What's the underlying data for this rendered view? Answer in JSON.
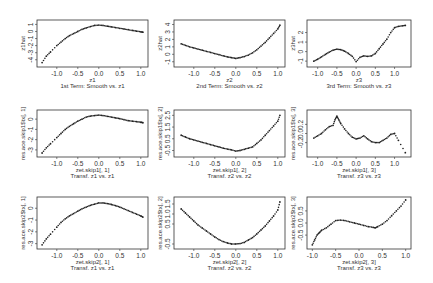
{
  "chart_data": [
    {
      "type": "scatter",
      "panel": [
        0,
        0
      ],
      "title": "1st Term: Smooth vs. z1",
      "xlabel": "z1",
      "ylabel": "z1hat",
      "xlim": [
        -1.4,
        1.1
      ],
      "ylim": [
        -4.6,
        1.2
      ],
      "xticks": [
        "-1.0",
        "-0.5",
        "0.0",
        "0.5",
        "1.0"
      ],
      "yticks": [
        "-4",
        "-3",
        "-2",
        "-1",
        "0",
        "1"
      ],
      "x": [
        -1.35,
        -1.25,
        -1.15,
        -1.0,
        -0.9,
        -0.8,
        -0.7,
        -0.6,
        -0.5,
        -0.4,
        -0.3,
        -0.2,
        -0.1,
        0.0,
        0.1,
        0.2,
        0.3,
        0.4,
        0.5,
        0.6,
        0.7,
        0.8,
        0.9,
        1.0,
        1.05
      ],
      "y": [
        -4.4,
        -3.5,
        -2.9,
        -2.0,
        -1.5,
        -1.0,
        -0.6,
        -0.3,
        0.0,
        0.3,
        0.5,
        0.7,
        0.85,
        0.9,
        0.85,
        0.75,
        0.65,
        0.55,
        0.45,
        0.35,
        0.25,
        0.15,
        0.05,
        -0.05,
        -0.1
      ]
    },
    {
      "type": "scatter",
      "panel": [
        0,
        1
      ],
      "title": "2nd Term: Smooth vs. z2",
      "xlabel": "z2",
      "ylabel": "z2hat",
      "xlim": [
        -1.4,
        1.1
      ],
      "ylim": [
        -1.3,
        4.2
      ],
      "xticks": [
        "-1.0",
        "-0.5",
        "0.0",
        "0.5",
        "1.0"
      ],
      "yticks": [
        "-1",
        "0",
        "1",
        "2",
        "3",
        "4"
      ],
      "x": [
        -1.3,
        -1.2,
        -1.1,
        -1.0,
        -0.9,
        -0.8,
        -0.7,
        -0.6,
        -0.5,
        -0.4,
        -0.3,
        -0.2,
        -0.1,
        0.0,
        0.1,
        0.2,
        0.3,
        0.4,
        0.5,
        0.6,
        0.7,
        0.8,
        0.9,
        1.0,
        1.05
      ],
      "y": [
        1.4,
        1.2,
        1.0,
        0.85,
        0.7,
        0.55,
        0.4,
        0.25,
        0.1,
        -0.05,
        -0.2,
        -0.35,
        -0.45,
        -0.55,
        -0.45,
        -0.3,
        -0.1,
        0.2,
        0.6,
        1.1,
        1.6,
        2.2,
        2.8,
        3.4,
        3.9
      ]
    },
    {
      "type": "scatter",
      "panel": [
        0,
        2
      ],
      "title": "3rd Term: Smooth vs. z3",
      "xlabel": "z3",
      "ylabel": "z3hat",
      "xlim": [
        -1.2,
        1.35
      ],
      "ylim": [
        -1.3,
        3.0
      ],
      "xticks": [
        "-1.0",
        "-0.5",
        "0.0",
        "0.5",
        "1.0"
      ],
      "yticks": [
        "-1",
        "0",
        "1",
        "2"
      ],
      "x": [
        -1.1,
        -1.0,
        -0.9,
        -0.8,
        -0.7,
        -0.6,
        -0.5,
        -0.4,
        -0.3,
        -0.2,
        -0.1,
        0.0,
        0.1,
        0.2,
        0.3,
        0.4,
        0.5,
        0.6,
        0.7,
        0.8,
        0.9,
        1.0,
        1.1,
        1.2,
        1.28
      ],
      "y": [
        -1.0,
        -0.8,
        -0.55,
        -0.3,
        -0.05,
        0.15,
        0.25,
        0.2,
        0.05,
        -0.2,
        -0.5,
        -1.05,
        -0.6,
        -0.45,
        -0.5,
        -0.45,
        -0.2,
        0.3,
        0.8,
        1.3,
        2.0,
        2.5,
        2.65,
        2.7,
        2.75
      ]
    },
    {
      "type": "scatter",
      "panel": [
        1,
        0
      ],
      "title": "Transf. z1 vs. z1",
      "xlabel": "zet.skip1[, 1]",
      "ylabel": "res.ace.skip1$tx[, 1]",
      "xlim": [
        -1.4,
        1.1
      ],
      "ylim": [
        -3.4,
        0.6
      ],
      "xticks": [
        "-1.0",
        "-0.5",
        "0.0",
        "0.5",
        "1.0"
      ],
      "yticks": [
        "-3",
        "-2",
        "-1",
        "0"
      ],
      "x": [
        -1.35,
        -1.25,
        -1.15,
        -1.0,
        -0.9,
        -0.8,
        -0.7,
        -0.6,
        -0.5,
        -0.4,
        -0.3,
        -0.2,
        -0.1,
        0.0,
        0.1,
        0.2,
        0.3,
        0.4,
        0.5,
        0.6,
        0.7,
        0.8,
        0.9,
        1.0,
        1.05
      ],
      "y": [
        -3.3,
        -2.8,
        -2.4,
        -1.8,
        -1.4,
        -1.0,
        -0.7,
        -0.45,
        -0.2,
        0.0,
        0.2,
        0.3,
        0.35,
        0.4,
        0.35,
        0.28,
        0.2,
        0.12,
        0.05,
        -0.05,
        -0.15,
        -0.2,
        -0.25,
        -0.3,
        -0.35
      ]
    },
    {
      "type": "scatter",
      "panel": [
        1,
        1
      ],
      "title": "Transf. z2 vs. z2",
      "xlabel": "zet.skip1[, 2]",
      "ylabel": "res.ace.skip1$tx[, 2]",
      "xlim": [
        -1.4,
        1.1
      ],
      "ylim": [
        -0.8,
        2.7
      ],
      "xticks": [
        "-1.0",
        "-0.5",
        "0.0",
        "0.5",
        "1.0"
      ],
      "yticks": [
        "-0.5",
        "0.5",
        "1.5",
        "2.5"
      ],
      "x": [
        -1.3,
        -1.2,
        -1.1,
        -1.0,
        -0.9,
        -0.8,
        -0.7,
        -0.6,
        -0.5,
        -0.4,
        -0.3,
        -0.2,
        -0.1,
        0.0,
        0.1,
        0.2,
        0.3,
        0.4,
        0.5,
        0.6,
        0.7,
        0.8,
        0.9,
        1.0,
        1.05
      ],
      "y": [
        0.8,
        0.65,
        0.5,
        0.4,
        0.3,
        0.2,
        0.1,
        0.0,
        -0.1,
        -0.2,
        -0.3,
        -0.38,
        -0.45,
        -0.55,
        -0.5,
        -0.4,
        -0.3,
        -0.2,
        0.1,
        0.4,
        0.8,
        1.2,
        1.6,
        2.0,
        2.5
      ]
    },
    {
      "type": "scatter",
      "panel": [
        1,
        2
      ],
      "title": "Transf. z3 vs. z3",
      "xlabel": "zet.skip1[, 3]",
      "ylabel": "res.ace.skip1$tx[, 3]",
      "xlim": [
        -1.2,
        1.35
      ],
      "ylim": [
        -0.45,
        0.45
      ],
      "xticks": [
        "-1.0",
        "-0.5",
        "0.0",
        "0.5",
        "1.0"
      ],
      "yticks": [
        "-0.2",
        "0.0",
        "0.2"
      ],
      "x": [
        -1.1,
        -1.0,
        -0.9,
        -0.8,
        -0.7,
        -0.6,
        -0.55,
        -0.5,
        -0.45,
        -0.4,
        -0.3,
        -0.2,
        -0.1,
        0.0,
        0.1,
        0.2,
        0.3,
        0.4,
        0.5,
        0.6,
        0.7,
        0.8,
        0.9,
        1.0,
        1.1,
        1.28
      ],
      "y": [
        -0.1,
        -0.05,
        0.0,
        0.08,
        0.15,
        0.18,
        0.3,
        0.38,
        0.3,
        0.22,
        0.1,
        0.0,
        -0.08,
        -0.12,
        -0.1,
        -0.05,
        -0.12,
        -0.18,
        -0.2,
        -0.2,
        -0.15,
        -0.1,
        -0.02,
        0.0,
        -0.15,
        -0.42
      ]
    },
    {
      "type": "scatter",
      "panel": [
        2,
        0
      ],
      "title": "Transf. z1 vs. z1",
      "xlabel": "zet.skip2[, 1]",
      "ylabel": "res.ace.skip2$tx[, 1]",
      "xlim": [
        -1.4,
        1.1
      ],
      "ylim": [
        -3.2,
        0.7
      ],
      "xticks": [
        "-1.0",
        "-0.5",
        "0.0",
        "0.5",
        "1.0"
      ],
      "yticks": [
        "-3",
        "-2",
        "-1",
        "0"
      ],
      "x": [
        -1.35,
        -1.25,
        -1.15,
        -1.0,
        -0.9,
        -0.8,
        -0.7,
        -0.6,
        -0.5,
        -0.4,
        -0.3,
        -0.2,
        -0.1,
        0.0,
        0.1,
        0.2,
        0.3,
        0.4,
        0.5,
        0.6,
        0.7,
        0.8,
        0.9,
        1.0,
        1.05
      ],
      "y": [
        -3.1,
        -2.6,
        -2.2,
        -1.6,
        -1.2,
        -0.9,
        -0.65,
        -0.45,
        -0.25,
        -0.05,
        0.1,
        0.25,
        0.35,
        0.45,
        0.45,
        0.4,
        0.32,
        0.22,
        0.1,
        -0.05,
        -0.2,
        -0.35,
        -0.5,
        -0.65,
        -0.75
      ]
    },
    {
      "type": "scatter",
      "panel": [
        2,
        1
      ],
      "title": "Transf. z2 vs. z2",
      "xlabel": "zet.skip2[, 2]",
      "ylabel": "res.ace.skip2$tx[, 2]",
      "xlim": [
        -1.4,
        1.1
      ],
      "ylim": [
        -0.6,
        1.7
      ],
      "xticks": [
        "-1.0",
        "-0.5",
        "0.0",
        "0.5",
        "1.0"
      ],
      "yticks": [
        "-0.5",
        "0.5",
        "1.0",
        "1.5"
      ],
      "x": [
        -1.3,
        -1.2,
        -1.1,
        -1.0,
        -0.9,
        -0.8,
        -0.7,
        -0.6,
        -0.5,
        -0.4,
        -0.3,
        -0.2,
        -0.1,
        0.0,
        0.1,
        0.2,
        0.3,
        0.4,
        0.5,
        0.6,
        0.7,
        0.8,
        0.9,
        1.0,
        1.05
      ],
      "y": [
        1.25,
        1.05,
        0.85,
        0.65,
        0.45,
        0.3,
        0.15,
        0.0,
        -0.15,
        -0.28,
        -0.38,
        -0.45,
        -0.5,
        -0.5,
        -0.48,
        -0.42,
        -0.3,
        -0.18,
        0.0,
        0.2,
        0.4,
        0.65,
        0.9,
        1.2,
        1.6
      ]
    },
    {
      "type": "scatter",
      "panel": [
        2,
        2
      ],
      "title": "Transf. z3 vs. z3",
      "xlabel": "zet.skip2[, 3]",
      "ylabel": "res.ace.skip2$tx[, 3]",
      "xlim": [
        -1.05,
        1.05
      ],
      "ylim": [
        -0.95,
        0.95
      ],
      "xticks": [
        "-1.0",
        "-0.5",
        "0.0",
        "0.5",
        "1.0"
      ],
      "yticks": [
        "-0.5",
        "0.0",
        "0.5"
      ],
      "x": [
        -1.0,
        -0.95,
        -0.9,
        -0.85,
        -0.8,
        -0.7,
        -0.6,
        -0.5,
        -0.4,
        -0.3,
        -0.2,
        -0.1,
        0.0,
        0.1,
        0.2,
        0.3,
        0.35,
        0.4,
        0.5,
        0.6,
        0.7,
        0.8,
        0.9,
        1.0
      ],
      "y": [
        -0.9,
        -0.7,
        -0.5,
        -0.4,
        -0.3,
        -0.2,
        -0.05,
        0.1,
        0.12,
        0.1,
        0.05,
        0.0,
        -0.05,
        -0.1,
        -0.15,
        -0.18,
        -0.2,
        -0.15,
        -0.05,
        0.1,
        0.3,
        0.5,
        0.7,
        0.95
      ]
    }
  ],
  "layout": {
    "panels": [
      {
        "x": 37,
        "y": 20,
        "w": 111,
        "h": 47
      },
      {
        "x": 174,
        "y": 20,
        "w": 111,
        "h": 47
      },
      {
        "x": 307,
        "y": 20,
        "w": 104,
        "h": 47
      },
      {
        "x": 37,
        "y": 110,
        "w": 111,
        "h": 47
      },
      {
        "x": 174,
        "y": 110,
        "w": 111,
        "h": 47
      },
      {
        "x": 307,
        "y": 110,
        "w": 104,
        "h": 47
      },
      {
        "x": 37,
        "y": 197,
        "w": 111,
        "h": 52
      },
      {
        "x": 174,
        "y": 197,
        "w": 111,
        "h": 52
      },
      {
        "x": 307,
        "y": 197,
        "w": 104,
        "h": 52
      }
    ],
    "point_color": "#222222",
    "frame_color": "#333333"
  }
}
